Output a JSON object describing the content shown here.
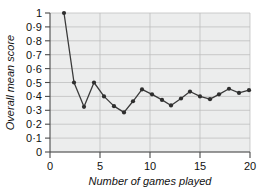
{
  "chart_data": {
    "type": "line",
    "title": "",
    "xlabel": "Number of games played",
    "ylabel": "Overall mean score",
    "xlim": [
      0,
      20
    ],
    "ylim": [
      0,
      1
    ],
    "grid": true,
    "legend": null,
    "x_ticks": [
      "0",
      "5",
      "10",
      "15",
      "20"
    ],
    "x_tick_values": [
      0,
      5,
      10,
      15,
      20
    ],
    "y_ticks": [
      "0",
      "0·1",
      "0·2",
      "0·3",
      "0·4",
      "0·5",
      "0·6",
      "0·7",
      "0·8",
      "0·9",
      "1"
    ],
    "y_tick_values": [
      0,
      0.1,
      0.2,
      0.3,
      0.4,
      0.5,
      0.6,
      0.7,
      0.8,
      0.9,
      1
    ],
    "series": [
      {
        "name": "Overall mean score",
        "marker": "circle",
        "x": [
          1.4,
          2.4,
          3.4,
          4.4,
          5.4,
          6.4,
          7.4,
          8.3,
          9.2,
          10.2,
          11.2,
          12.1,
          13.1,
          14.0,
          15.0,
          16.0,
          16.9,
          17.9,
          18.9,
          19.9
        ],
        "values": [
          1.0,
          0.5,
          0.325,
          0.5,
          0.4,
          0.33,
          0.285,
          0.365,
          0.45,
          0.415,
          0.375,
          0.335,
          0.385,
          0.435,
          0.4,
          0.38,
          0.415,
          0.455,
          0.425,
          0.445
        ]
      }
    ],
    "colors": {
      "line": "#3a3a3a",
      "marker": "#2e2e2e",
      "plot_background": "#eceded",
      "gridline": "#b9b9b9",
      "axis": "#4a4a4a",
      "text": "#111111"
    }
  }
}
